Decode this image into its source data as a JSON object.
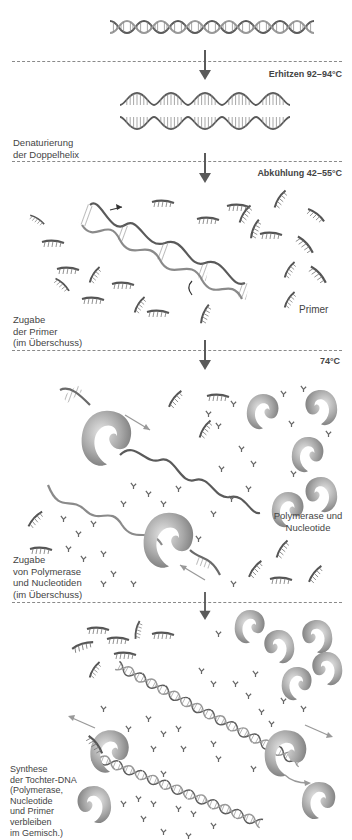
{
  "figure": {
    "steps": [
      {
        "id": "start",
        "caption": "",
        "condition": ""
      },
      {
        "id": "denaturation",
        "condition": "Erhitzen 92–94°C",
        "caption": "Denaturierung\nder Doppelhelix"
      },
      {
        "id": "annealing",
        "condition": "Abkühlung 42–55°C",
        "caption": "Zugabe\nder Primer\n(im Überschuss)",
        "callout": "Primer"
      },
      {
        "id": "extension",
        "condition": "74°C",
        "caption": "Zugabe\nvon Polymerase\nund Nucleotiden\n(im Überschuss)",
        "callout": "Polymerase und\nNucleotide"
      },
      {
        "id": "synthesis",
        "condition": "",
        "caption": "Synthese\nder Tochter-DNA\n(Polymerase,\nNucleotide\nund Primer\nverbleiben\nim Gemisch.)"
      }
    ]
  },
  "colors": {
    "strand_dark": "#5a5a5a",
    "strand_light": "#9a9a9a",
    "polymerase": "#a8a8a8",
    "divider": "#8a8a8a",
    "arrow": "#5a5a5a",
    "text": "#444444"
  }
}
